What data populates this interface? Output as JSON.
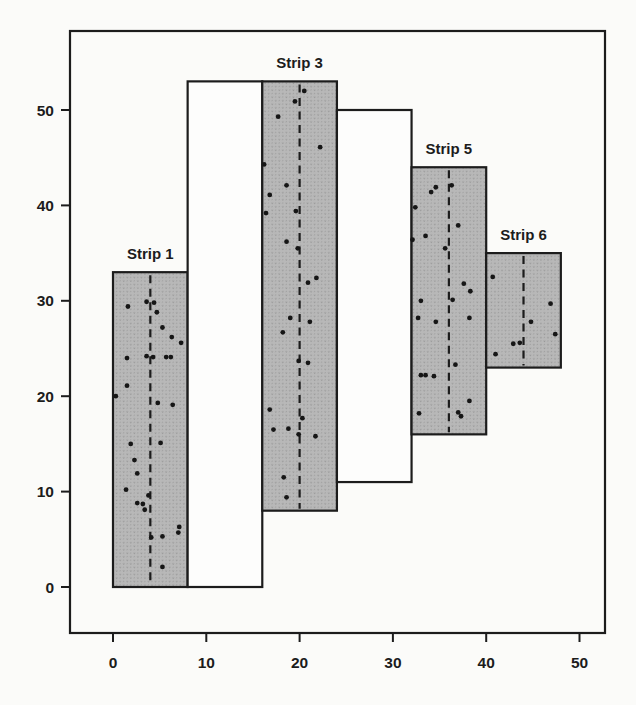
{
  "page": {
    "background": "#fbfbf9"
  },
  "chart_data": {
    "type": "scatter",
    "title": "",
    "subtitle": "",
    "xlabel": "",
    "ylabel": "",
    "xlim": [
      0,
      50
    ],
    "ylim": [
      0,
      50
    ],
    "grid": false,
    "legend": "none",
    "x_tick_labels": [
      "0",
      "10",
      "20",
      "30",
      "40",
      "50"
    ],
    "y_tick_labels": [
      "0",
      "10",
      "20",
      "30",
      "40",
      "50"
    ],
    "x_tick_values": [
      0,
      10,
      20,
      30,
      40,
      50
    ],
    "y_tick_values": [
      0,
      10,
      20,
      30,
      40,
      50
    ],
    "colors": {
      "ink": "#1c1c1c",
      "strip_fill_base": "#b8b8b8",
      "strip_fill_speckle": "#8d8d8d",
      "unsampled_fill": "#fdfdfc",
      "dot": "#161616",
      "background": "#fbfbf9"
    },
    "strips": [
      {
        "id": "strip-1",
        "label": "Strip 1",
        "x0": 0,
        "x1": 8,
        "y0": 0,
        "y1": 33,
        "shaded": true,
        "centerline_x": 4,
        "points": [
          [
            1.6,
            29.4
          ],
          [
            3.6,
            29.9
          ],
          [
            4.4,
            29.8
          ],
          [
            4.7,
            28.8
          ],
          [
            5.3,
            27.2
          ],
          [
            6.3,
            26.2
          ],
          [
            7.3,
            25.6
          ],
          [
            1.5,
            24.0
          ],
          [
            3.6,
            24.2
          ],
          [
            4.3,
            24.1
          ],
          [
            5.7,
            24.1
          ],
          [
            6.2,
            24.1
          ],
          [
            1.5,
            21.1
          ],
          [
            0.3,
            20.0
          ],
          [
            4.8,
            19.3
          ],
          [
            6.4,
            19.1
          ],
          [
            1.9,
            15.0
          ],
          [
            5.1,
            15.1
          ],
          [
            2.3,
            13.3
          ],
          [
            2.6,
            11.9
          ],
          [
            1.4,
            10.2
          ],
          [
            3.8,
            9.6
          ],
          [
            2.6,
            8.8
          ],
          [
            3.2,
            8.7
          ],
          [
            3.4,
            8.1
          ],
          [
            7.1,
            6.3
          ],
          [
            7.0,
            5.7
          ],
          [
            5.3,
            5.3
          ],
          [
            4.1,
            5.2
          ],
          [
            5.3,
            2.1
          ]
        ]
      },
      {
        "id": "strip-2",
        "label": "",
        "x0": 8,
        "x1": 16,
        "y0": 0,
        "y1": 53,
        "shaded": false,
        "centerline_x": null,
        "points": []
      },
      {
        "id": "strip-3",
        "label": "Strip 3",
        "x0": 16,
        "x1": 24,
        "y0": 8,
        "y1": 53,
        "shaded": true,
        "centerline_x": 20,
        "points": [
          [
            20.5,
            52.0
          ],
          [
            19.5,
            50.9
          ],
          [
            17.7,
            49.3
          ],
          [
            22.2,
            46.1
          ],
          [
            16.2,
            44.3
          ],
          [
            18.6,
            42.1
          ],
          [
            16.8,
            41.1
          ],
          [
            16.4,
            39.2
          ],
          [
            19.6,
            39.4
          ],
          [
            18.6,
            36.2
          ],
          [
            19.8,
            35.5
          ],
          [
            21.8,
            32.4
          ],
          [
            20.9,
            31.9
          ],
          [
            19.0,
            28.2
          ],
          [
            21.1,
            27.8
          ],
          [
            18.2,
            26.7
          ],
          [
            19.9,
            23.7
          ],
          [
            20.9,
            23.5
          ],
          [
            16.8,
            18.6
          ],
          [
            20.3,
            17.7
          ],
          [
            17.2,
            16.5
          ],
          [
            18.8,
            16.6
          ],
          [
            19.9,
            16.0
          ],
          [
            21.7,
            15.8
          ],
          [
            18.3,
            11.5
          ],
          [
            18.6,
            9.4
          ]
        ]
      },
      {
        "id": "strip-4",
        "label": "",
        "x0": 24,
        "x1": 32,
        "y0": 11,
        "y1": 50,
        "shaded": false,
        "centerline_x": null,
        "points": []
      },
      {
        "id": "strip-5",
        "label": "Strip 5",
        "x0": 32,
        "x1": 40,
        "y0": 16,
        "y1": 44,
        "shaded": true,
        "centerline_x": 36,
        "points": [
          [
            34.6,
            41.9
          ],
          [
            34.1,
            41.4
          ],
          [
            36.3,
            42.1
          ],
          [
            32.4,
            39.8
          ],
          [
            37.0,
            37.9
          ],
          [
            33.5,
            36.8
          ],
          [
            32.1,
            36.4
          ],
          [
            35.6,
            35.5
          ],
          [
            37.6,
            31.8
          ],
          [
            38.3,
            31.0
          ],
          [
            33.0,
            30.0
          ],
          [
            36.4,
            30.1
          ],
          [
            32.7,
            28.2
          ],
          [
            34.6,
            27.8
          ],
          [
            38.2,
            28.2
          ],
          [
            36.7,
            23.3
          ],
          [
            33.0,
            22.2
          ],
          [
            33.5,
            22.2
          ],
          [
            34.4,
            22.1
          ],
          [
            38.2,
            19.5
          ],
          [
            32.8,
            18.2
          ],
          [
            37.0,
            18.3
          ],
          [
            37.3,
            17.9
          ]
        ]
      },
      {
        "id": "strip-6",
        "label": "Strip 6",
        "x0": 40,
        "x1": 48,
        "y0": 23,
        "y1": 35,
        "shaded": true,
        "centerline_x": 44,
        "points": [
          [
            40.7,
            32.5
          ],
          [
            46.9,
            29.7
          ],
          [
            44.8,
            27.8
          ],
          [
            42.9,
            25.5
          ],
          [
            43.6,
            25.6
          ],
          [
            41.0,
            24.4
          ],
          [
            47.4,
            26.5
          ]
        ]
      }
    ]
  }
}
